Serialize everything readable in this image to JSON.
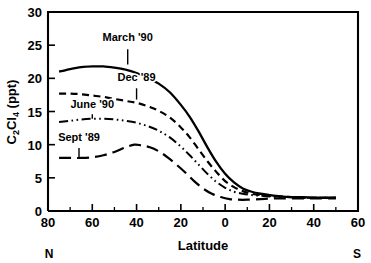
{
  "chart_data": {
    "type": "line",
    "title": "",
    "xlabel": "Latitude",
    "ylabel": "C2Cl4 (ppt)",
    "ylabel_parts": {
      "c": "C",
      "sub2": "2",
      "cl": "Cl",
      "sub4": "4",
      "units": " (ppt)"
    },
    "xlim": [
      80,
      -60
    ],
    "ylim": [
      0,
      30
    ],
    "grid": false,
    "legend": "inline-labels",
    "x_tick_labels": [
      "80",
      "60",
      "40",
      "20",
      "0",
      "20",
      "40",
      "60"
    ],
    "x_tick_values": [
      80,
      60,
      40,
      20,
      0,
      -20,
      -40,
      -60
    ],
    "x_minor_values": [
      70,
      50,
      30,
      10,
      -10,
      -30,
      -50
    ],
    "y_tick_labels": [
      "0",
      "5",
      "10",
      "15",
      "20",
      "25",
      "30"
    ],
    "y_tick_values": [
      0,
      5,
      10,
      15,
      20,
      25,
      30
    ],
    "hemisphere_left": "N",
    "hemisphere_right": "S",
    "series": [
      {
        "name": "March '90",
        "style": "solid",
        "label_x": 44,
        "label_y": 25.6,
        "leader_from": [
          44,
          24.4
        ],
        "leader_to": [
          44,
          22.1
        ],
        "x": [
          75,
          70,
          65,
          60,
          55,
          50,
          45,
          40,
          35,
          30,
          25,
          20,
          16,
          12,
          8,
          4,
          0,
          -4,
          -8,
          -12,
          -16,
          -20,
          -25,
          -30,
          -35,
          -40,
          -45,
          -50
        ],
        "y": [
          21.0,
          21.4,
          21.7,
          21.8,
          21.8,
          21.6,
          21.3,
          20.8,
          20.1,
          19.2,
          17.9,
          16.0,
          14.2,
          12.0,
          9.6,
          7.4,
          5.6,
          4.3,
          3.4,
          2.9,
          2.6,
          2.4,
          2.2,
          2.1,
          2.1,
          2.0,
          2.0,
          2.0
        ]
      },
      {
        "name": "Dec '89",
        "style": "dashed",
        "label_x": 40,
        "label_y": 19.6,
        "leader_from": [
          40,
          18.5
        ],
        "leader_to": [
          40,
          16.8
        ],
        "x": [
          75,
          70,
          65,
          60,
          55,
          50,
          45,
          40,
          35,
          30,
          25,
          20,
          16,
          12,
          8,
          4,
          0,
          -4,
          -8,
          -12,
          -16,
          -20,
          -25,
          -30,
          -35,
          -40,
          -45,
          -50
        ],
        "y": [
          17.7,
          17.7,
          17.6,
          17.4,
          17.2,
          16.9,
          16.6,
          16.3,
          15.8,
          15.1,
          14.1,
          12.6,
          11.1,
          9.3,
          7.5,
          5.9,
          4.5,
          3.6,
          3.0,
          2.6,
          2.4,
          2.3,
          2.2,
          2.1,
          2.0,
          2.0,
          2.0,
          2.0
        ]
      },
      {
        "name": "June '90",
        "style": "dashdotdot",
        "label_x": 60,
        "label_y": 15.6,
        "leader_from": [
          60,
          14.6
        ],
        "leader_to": [
          60,
          13.9
        ],
        "x": [
          75,
          70,
          65,
          60,
          55,
          50,
          45,
          40,
          35,
          30,
          25,
          20,
          16,
          12,
          8,
          4,
          0,
          -4,
          -8,
          -12,
          -16,
          -20,
          -25,
          -30,
          -35,
          -40,
          -45,
          -50
        ],
        "y": [
          13.4,
          13.6,
          13.8,
          13.9,
          13.9,
          13.8,
          13.6,
          13.3,
          12.8,
          12.1,
          11.1,
          9.7,
          8.4,
          7.0,
          5.6,
          4.4,
          3.5,
          2.9,
          2.6,
          2.4,
          2.3,
          2.2,
          2.1,
          2.1,
          2.0,
          2.0,
          2.0,
          2.0
        ]
      },
      {
        "name": "Sept '89",
        "style": "longdash",
        "label_x": 66,
        "label_y": 10.6,
        "leader_from": [
          66,
          9.5
        ],
        "leader_to": [
          66,
          8.1
        ],
        "x": [
          75,
          70,
          65,
          60,
          55,
          50,
          45,
          41,
          38,
          34,
          30,
          26,
          22,
          18,
          14,
          10,
          6,
          2,
          -2,
          -6,
          -10,
          -16,
          -22,
          -30,
          -40,
          -50
        ],
        "y": [
          8.0,
          8.0,
          8.0,
          8.1,
          8.4,
          8.9,
          9.6,
          10.0,
          9.9,
          9.6,
          9.0,
          8.1,
          7.0,
          5.8,
          4.5,
          3.4,
          2.6,
          2.1,
          1.8,
          1.7,
          1.7,
          1.8,
          1.9,
          1.9,
          1.9,
          1.9
        ]
      }
    ]
  },
  "colors": {
    "ink": "#000000",
    "background": "#ffffff"
  }
}
